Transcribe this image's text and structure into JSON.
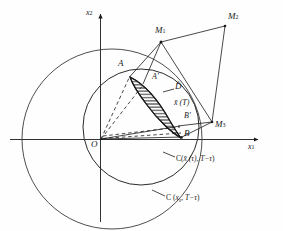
{
  "figure": {
    "type": "geometric-diagram",
    "background_color": "#fefefe",
    "stroke_color": "#1a1a1a"
  },
  "axes": {
    "x_label": "x",
    "x_sub": "1",
    "y_label": "x",
    "y_sub": "2",
    "origin_label": "O"
  },
  "points": [
    {
      "name": "origin",
      "label": "O",
      "x": 100,
      "y": 140
    },
    {
      "name": "point-A",
      "label": "A",
      "x": 124,
      "y": 70
    },
    {
      "name": "point-A-prime",
      "label": "A'",
      "x": 152,
      "y": 83
    },
    {
      "name": "point-B-prime",
      "label": "B'",
      "x": 184,
      "y": 121
    },
    {
      "name": "point-B",
      "label": "B",
      "x": 182,
      "y": 136
    },
    {
      "name": "point-M1",
      "label": "M",
      "sub": "1",
      "x": 160,
      "y": 36
    },
    {
      "name": "point-M2",
      "label": "M",
      "sub": "2",
      "x": 228,
      "y": 20
    },
    {
      "name": "point-M3",
      "label": "M",
      "sub": "3",
      "x": 213,
      "y": 126
    }
  ],
  "labels": {
    "region_D": "D̂",
    "curve_xbar_T": "x̄ (T)",
    "circle_inner": "C( x̄ (τ), T−τ )",
    "circle_outer": "C ( x₀ , T−τ )",
    "circle_inner_parts": {
      "open": "C(",
      "arg1": "x̄ (τ)",
      "comma": ",",
      "arg2": "T−τ",
      "close": ")"
    },
    "circle_outer_parts": {
      "open": "C (",
      "arg1": "x₀",
      "comma": ",",
      "arg2": "T−τ",
      "close": ")"
    },
    "xbar_T_parts": {
      "sym": "x̄",
      "arg": "(T)"
    }
  },
  "circles": [
    {
      "name": "outer-circle",
      "cx": 112,
      "cy": 139,
      "r": 90,
      "label_ref": "circle_outer"
    },
    {
      "name": "inner-circle",
      "cx": 141,
      "cy": 127,
      "r": 58,
      "label_ref": "circle_inner"
    }
  ],
  "hatched_region": {
    "name": "lens-region-D-hat",
    "fill": "horizontal-hatching",
    "label": "D̂"
  },
  "polygon": {
    "name": "polygon-M1-M2-M3",
    "vertices": [
      "M1",
      "M2",
      "M3"
    ]
  },
  "dashed_lines": {
    "name": "dashed-rays-from-origin",
    "count": 4
  }
}
